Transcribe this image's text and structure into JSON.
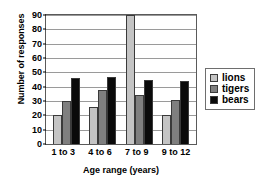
{
  "chart_data": {
    "type": "bar",
    "title": "",
    "xlabel": "Age  range (years)",
    "ylabel": "Number of responses",
    "categories": [
      "1 to 3",
      "4 to 6",
      "7 to 9",
      "9 to 12"
    ],
    "series": [
      {
        "name": "lions",
        "color": "#c4c4c4",
        "values": [
          20,
          26,
          90,
          20
        ]
      },
      {
        "name": "tigers",
        "color": "#7f7f7f",
        "values": [
          30,
          38,
          34,
          31
        ]
      },
      {
        "name": "bears",
        "color": "#0a0a0a",
        "values": [
          46,
          47,
          45,
          44
        ]
      }
    ],
    "ylim": [
      0,
      90
    ],
    "ytick_values": [
      0,
      10,
      20,
      30,
      40,
      50,
      60,
      70,
      80,
      90
    ],
    "ytick_labels": [
      "0",
      "10",
      "20",
      "30",
      "40",
      "50",
      "60",
      "70",
      "80",
      "90"
    ],
    "grid": true,
    "grid_axis": "y",
    "legend_position": "right",
    "legend_entries": [
      "lions",
      "tigers",
      "bears"
    ]
  }
}
